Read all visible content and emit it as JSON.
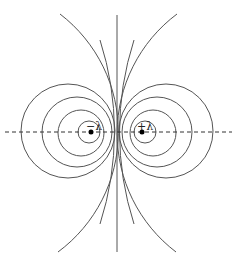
{
  "diagram": {
    "type": "equipotential-lines-two-line-charges",
    "charges": [
      {
        "label": "−λ",
        "x": 91,
        "y": 132,
        "sign": "negative"
      },
      {
        "label": "+λ",
        "x": 142,
        "y": 132,
        "sign": "positive"
      }
    ],
    "axis": {
      "y": 132,
      "x1": 5,
      "x2": 232,
      "style": "dashed"
    },
    "midline": {
      "x": 117,
      "y1": 15,
      "y2": 252
    },
    "left_circles": [
      {
        "cx": 68,
        "cy": 131,
        "r": 47
      },
      {
        "cx": 77,
        "cy": 132,
        "r": 35
      },
      {
        "cx": 81,
        "cy": 133,
        "r": 23
      },
      {
        "cx": 89,
        "cy": 132,
        "r": 11
      }
    ],
    "right_circles": [
      {
        "cx": 166,
        "cy": 131,
        "r": 47
      },
      {
        "cx": 157,
        "cy": 132,
        "r": 35
      },
      {
        "cx": 153,
        "cy": 133,
        "r": 23
      },
      {
        "cx": 145,
        "cy": 132,
        "r": 11
      }
    ],
    "colors": {
      "line": "#555555",
      "dot": "#000000"
    }
  }
}
